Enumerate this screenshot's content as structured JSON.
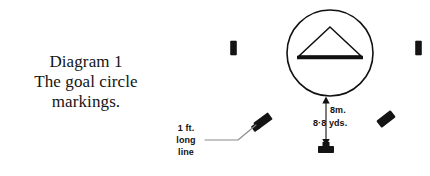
{
  "figure": {
    "caption": {
      "lines": [
        "Diagram 1",
        "The goal circle",
        "markings."
      ]
    },
    "annotations": {
      "long_line_label": {
        "lines": [
          "1 ft.",
          "long",
          "line"
        ]
      },
      "distance_metric": "8m.",
      "distance_imperial": "8·8 yds."
    },
    "colors": {
      "ink": "#111111",
      "paper": "#ffffff",
      "leader_line": "#8a8a8a"
    },
    "elements": {
      "goal_circle": "goal-circle",
      "goal_triangle": "goal-triangle",
      "left_post_marker": "left-post-marker",
      "right_post_marker": "right-post-marker",
      "left_diagonal_marker": "left-diagonal-marker",
      "right_diagonal_marker": "right-diagonal-marker",
      "penalty_spot_marker": "penalty-spot-marker",
      "dimension_arrow": "dimension-arrow",
      "leader_line": "leader-line"
    }
  }
}
